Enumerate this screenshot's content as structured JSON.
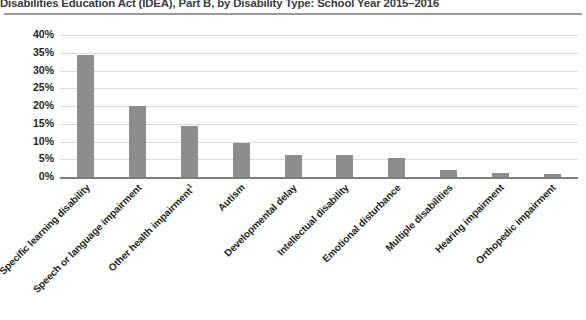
{
  "chart_data": {
    "type": "bar",
    "title": "Disabilities Education Act (IDEA), Part B, by Disability Type: School Year 2015–2016",
    "xlabel": "",
    "ylabel": "",
    "ylim": [
      0,
      40
    ],
    "ytick_labels": [
      "40%",
      "35%",
      "30%",
      "25%",
      "20%",
      "15%",
      "10%",
      "5%",
      "0%"
    ],
    "ytick_values": [
      40,
      35,
      30,
      25,
      20,
      15,
      10,
      5,
      0
    ],
    "grid": true,
    "legend": "none",
    "bar_color": "#8d8d8d",
    "categories": [
      "Specific learning disability",
      "Speech or language impairment",
      "Other health impairment",
      "Autism",
      "Developmental delay",
      "Intellectual disability",
      "Emotional disturbance",
      "Multiple disabilities",
      "Hearing impairment",
      "Orthopedic impairment"
    ],
    "category_footnotes": [
      "",
      "",
      "1",
      "",
      "",
      "",
      "",
      "",
      "",
      ""
    ],
    "values": [
      34.4,
      20.0,
      14.3,
      9.5,
      6.1,
      6.1,
      5.3,
      2.0,
      1.0,
      0.9
    ],
    "value_labels": [
      "34.4%",
      "20.0%",
      "14.3%",
      "9.5%",
      "6.1%",
      "6.1%",
      "5.3%",
      "2.0%",
      "1.0%",
      "0.9%"
    ]
  }
}
